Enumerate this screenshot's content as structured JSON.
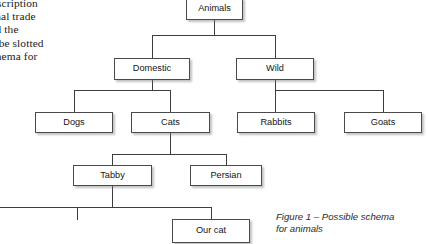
{
  "document": {
    "body_text": "y, the description  of the national trade  have restricted the  concepts may not be slotted  into a relevant schema for  other concepts.",
    "body_lines": [
      "y, the description",
      "ne national trade",
      "  restricted  the",
      "may not be slotted",
      "evant schema for",
      "epts."
    ]
  },
  "figure": {
    "caption": "Figure 1 – Possible schema for animals",
    "caption_line_1": "Figure 1 – Possible schema",
    "caption_line_2": "for animals"
  },
  "diagram": {
    "type": "tree",
    "nodes": [
      {
        "id": "animals",
        "label": "Animals",
        "level": 0,
        "parent": null
      },
      {
        "id": "domestic",
        "label": "Domestic",
        "level": 1,
        "parent": "animals"
      },
      {
        "id": "wild",
        "label": "Wild",
        "level": 1,
        "parent": "animals"
      },
      {
        "id": "dogs",
        "label": "Dogs",
        "level": 2,
        "parent": "domestic"
      },
      {
        "id": "cats",
        "label": "Cats",
        "level": 2,
        "parent": "domestic"
      },
      {
        "id": "rabbits",
        "label": "Rabbits",
        "level": 2,
        "parent": "wild"
      },
      {
        "id": "goats",
        "label": "Goats",
        "level": 2,
        "parent": "wild"
      },
      {
        "id": "tabby",
        "label": "Tabby",
        "level": 3,
        "parent": "cats"
      },
      {
        "id": "persian",
        "label": "Persian",
        "level": 3,
        "parent": "cats"
      },
      {
        "id": "ourcat",
        "label": "Our cat",
        "level": 4,
        "parent": "tabby"
      }
    ],
    "labels": {
      "animals": "Animals",
      "domestic": "Domestic",
      "wild": "Wild",
      "dogs": "Dogs",
      "cats": "Cats",
      "rabbits": "Rabbits",
      "goats": "Goats",
      "tabby": "Tabby",
      "persian": "Persian",
      "ourcat": "Our cat"
    },
    "colors": {
      "box_border": "#4a4a4a",
      "box_fill": "#ffffff",
      "line": "#3d3d3d",
      "text": "#141414",
      "page_background": "#ffffff"
    }
  }
}
